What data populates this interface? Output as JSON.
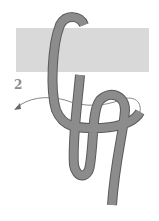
{
  "diagram": {
    "step_label": "2",
    "colors": {
      "bar": "#d9d9d9",
      "rope": "#8c8c8c",
      "rope_outline": "#5a5a5a",
      "arrow": "#6a6a6a"
    },
    "elements": [
      "horizontal-bar",
      "rope-knot",
      "direction-arrow",
      "step-number"
    ]
  }
}
